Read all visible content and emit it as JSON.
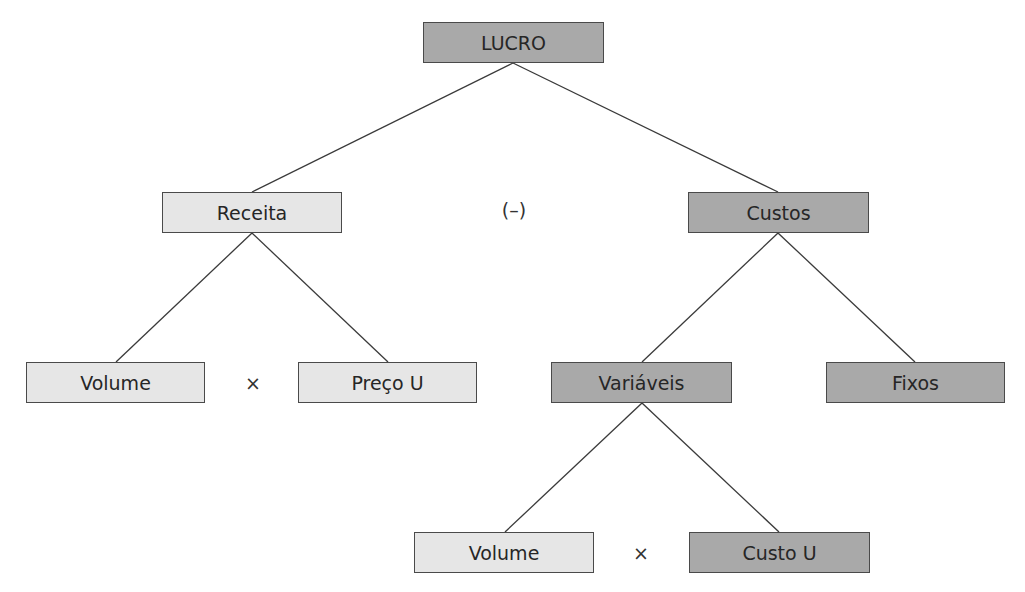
{
  "diagram": {
    "type": "tree",
    "nodes": [
      {
        "id": "lucro",
        "label": "LUCRO",
        "shade": "dark",
        "x": 423,
        "y": 22,
        "w": 181
      },
      {
        "id": "receita",
        "label": "Receita",
        "shade": "light",
        "x": 162,
        "y": 192,
        "w": 180
      },
      {
        "id": "custos",
        "label": "Custos",
        "shade": "dark",
        "x": 688,
        "y": 192,
        "w": 181
      },
      {
        "id": "volume1",
        "label": "Volume",
        "shade": "light",
        "x": 26,
        "y": 362,
        "w": 179
      },
      {
        "id": "preco",
        "label": "Preço U",
        "shade": "light",
        "x": 298,
        "y": 362,
        "w": 179
      },
      {
        "id": "variaveis",
        "label": "Variáveis",
        "shade": "dark",
        "x": 551,
        "y": 362,
        "w": 181
      },
      {
        "id": "fixos",
        "label": "Fixos",
        "shade": "dark",
        "x": 826,
        "y": 362,
        "w": 179
      },
      {
        "id": "volume2",
        "label": "Volume",
        "shade": "light",
        "x": 414,
        "y": 532,
        "w": 180
      },
      {
        "id": "custou",
        "label": "Custo U",
        "shade": "dark",
        "x": 689,
        "y": 532,
        "w": 181
      }
    ],
    "edges": [
      {
        "from": "lucro",
        "to": "receita"
      },
      {
        "from": "lucro",
        "to": "custos"
      },
      {
        "from": "receita",
        "to": "volume1"
      },
      {
        "from": "receita",
        "to": "preco"
      },
      {
        "from": "custos",
        "to": "variaveis"
      },
      {
        "from": "custos",
        "to": "fixos"
      },
      {
        "from": "variaveis",
        "to": "volume2"
      },
      {
        "from": "variaveis",
        "to": "custou"
      }
    ],
    "operators": [
      {
        "id": "minus",
        "label": "(–)",
        "x": 514,
        "y": 210
      },
      {
        "id": "times1",
        "label": "×",
        "x": 253,
        "y": 383
      },
      {
        "id": "times2",
        "label": "×",
        "x": 641,
        "y": 553
      }
    ],
    "colors": {
      "light": "#e6e6e6",
      "dark": "#a9a9a9",
      "border": "#4a4a4a",
      "line": "#3a3a3a"
    }
  }
}
